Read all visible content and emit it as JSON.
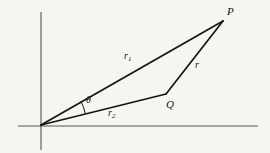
{
  "figure": {
    "kind": "geometry-diagram",
    "background_color": "#f6f5f2",
    "stroke_color": "#141414",
    "axis_color": "#555555",
    "width": 270,
    "height": 153,
    "axes": {
      "x_axis": {
        "x1": 18,
        "y1": 126,
        "x2": 258,
        "y2": 126
      },
      "y_axis": {
        "x1": 41,
        "y1": 12,
        "x2": 41,
        "y2": 150
      },
      "origin": {
        "x": 41,
        "y": 125
      }
    },
    "points": [
      {
        "id": "O",
        "label": "",
        "x": 41,
        "y": 125
      },
      {
        "id": "P",
        "label": "P",
        "x": 223,
        "y": 21
      },
      {
        "id": "Q",
        "label": "Q",
        "x": 166,
        "y": 94
      }
    ],
    "segments": [
      {
        "id": "r1",
        "label": "r",
        "subscript": "1",
        "from": "O",
        "to": "P",
        "x1": 41,
        "y1": 125,
        "x2": 223,
        "y2": 21
      },
      {
        "id": "r2",
        "label": "r",
        "subscript": "2",
        "from": "O",
        "to": "Q",
        "x1": 41,
        "y1": 125,
        "x2": 166,
        "y2": 94
      },
      {
        "id": "r",
        "label": "r",
        "subscript": "",
        "from": "Q",
        "to": "P",
        "x1": 166,
        "y1": 94,
        "x2": 223,
        "y2": 21
      }
    ],
    "angle": {
      "id": "theta",
      "label": "θ",
      "vertex": "O",
      "between": [
        "r2",
        "r1"
      ],
      "arc": {
        "cx": 41,
        "cy": 125,
        "radius": 46,
        "start_deg": 14,
        "end_deg": 30
      }
    }
  }
}
